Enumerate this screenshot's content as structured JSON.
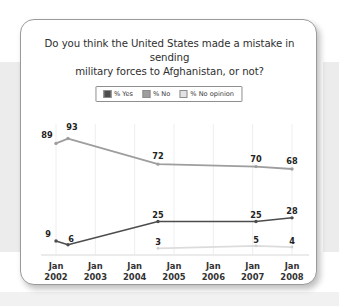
{
  "card": {
    "title_line1": "Do you think the United States made a mistake in sending",
    "title_line2": "military forces to Afghanistan, or not?"
  },
  "legend": {
    "items": [
      {
        "label": "% Yes",
        "color": "#4d4d4d"
      },
      {
        "label": "% No",
        "color": "#9e9e9e"
      },
      {
        "label": "% No opinion",
        "color": "#e2e2e2"
      }
    ]
  },
  "chart_data": {
    "type": "line",
    "title": "Do you think the United States made a mistake in sending military forces to Afghanistan, or not?",
    "xlabel": "",
    "ylabel": "",
    "ylim": [
      0,
      100
    ],
    "grid": "vertical",
    "legend_position": "top-center",
    "x_tick_labels": [
      {
        "line1": "Jan",
        "line2": "2002"
      },
      {
        "line1": "Jan",
        "line2": "2003"
      },
      {
        "line1": "Jan",
        "line2": "2004"
      },
      {
        "line1": "Jan",
        "line2": "2005"
      },
      {
        "line1": "Jan",
        "line2": "2006"
      },
      {
        "line1": "Jan",
        "line2": "2007"
      },
      {
        "line1": "Jan",
        "line2": "2008"
      }
    ],
    "x_positions_px": [
      35,
      47,
      137,
      235,
      271
    ],
    "series": [
      {
        "name": "% No",
        "color": "#9e9e9e",
        "values": [
          89,
          93,
          72,
          70,
          68
        ],
        "label_offsets": [
          {
            "dx": -9,
            "dy": -13
          },
          {
            "dx": 4,
            "dy": -17
          },
          {
            "dx": 0,
            "dy": -13
          },
          {
            "dx": 0,
            "dy": -13
          },
          {
            "dx": 0,
            "dy": -13
          }
        ]
      },
      {
        "name": "% Yes",
        "color": "#4d4d4d",
        "values": [
          9,
          6,
          25,
          25,
          28
        ],
        "label_offsets": [
          {
            "dx": -8,
            "dy": -12
          },
          {
            "dx": 3,
            "dy": -11
          },
          {
            "dx": 0,
            "dy": -12
          },
          {
            "dx": 0,
            "dy": -12
          },
          {
            "dx": 0,
            "dy": -12
          }
        ]
      },
      {
        "name": "% No opinion",
        "color": "#dcdcdc",
        "values": [
          null,
          null,
          3,
          5,
          4
        ],
        "label_offsets": [
          null,
          null,
          {
            "dx": 0,
            "dy": -11
          },
          {
            "dx": 0,
            "dy": -11
          },
          {
            "dx": 0,
            "dy": -11
          }
        ]
      }
    ]
  }
}
